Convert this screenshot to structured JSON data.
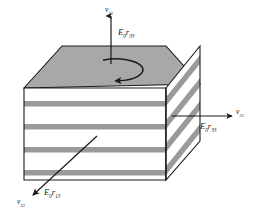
{
  "figure": {
    "object_name": "multilayer-block",
    "colors": {
      "layer_gray": "#9a9a9a",
      "top_face_gray": "#a8a8a8",
      "outline": "#1a1a1a",
      "background": "#ffffff",
      "label_color": "#1a1a1a"
    },
    "geometry": {
      "top_face_points": "24,88 62,46 166,46 200,84",
      "front_face_points": "24,88 166,88 166,180 24,180",
      "right_face_points": "166,88 200,46 200,141 166,180",
      "front_stripe_count": 4,
      "side_stripe_count": 4,
      "stripe_thickness_px": 5
    },
    "top_rotation_arrow": {
      "name": "rotation-arrow",
      "shape": "ellipse",
      "cx": 103,
      "cy": 71,
      "rx": 27,
      "ry": 11,
      "direction": "clockwise"
    }
  },
  "vectors": {
    "vertical": {
      "name": "vertical-vector",
      "arrow_from": [
        111,
        62
      ],
      "arrow_to": [
        111,
        14
      ],
      "v_label": {
        "sym": "v",
        "sub": "33"
      },
      "er_label": {
        "sym": "E",
        "sym_sub": "0",
        "sym2": "r",
        "sym2_sub": "33"
      }
    },
    "horizontal": {
      "name": "horizontal-vector",
      "arrow_from": [
        172,
        116
      ],
      "arrow_to": [
        233,
        116
      ],
      "v_label": {
        "sym": "v",
        "sub": "33"
      },
      "er_label": {
        "sym": "E",
        "sym_sub": "0",
        "sym2": "r",
        "sym2_sub": "33"
      }
    },
    "diagonal": {
      "name": "diagonal-vector",
      "arrow_from": [
        96,
        137
      ],
      "arrow_to": [
        32,
        196
      ],
      "v_label": {
        "sym": "v",
        "sub": "33"
      },
      "er_label": {
        "sym": "E",
        "sym_sub": "0",
        "sym2": "r",
        "sym2_sub": "13"
      }
    }
  },
  "labels": {
    "top_v": "v",
    "top_v_sub": "33",
    "top_er_E": "E",
    "top_er_E_sub": "0",
    "top_er_r": "r",
    "top_er_r_sub": "33",
    "right_v": "v",
    "right_v_sub": "33",
    "right_er_E": "E",
    "right_er_E_sub": "0",
    "right_er_r": "r",
    "right_er_r_sub": "33",
    "bottom_v": "v",
    "bottom_v_sub": "33",
    "bottom_er_E": "E",
    "bottom_er_E_sub": "0",
    "bottom_er_r": "r",
    "bottom_er_r_sub": "13"
  }
}
